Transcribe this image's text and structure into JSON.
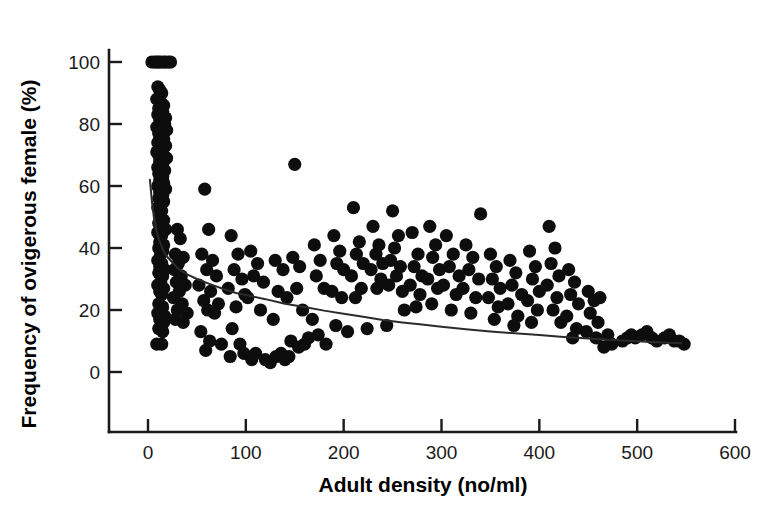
{
  "chart_data": {
    "type": "scatter",
    "title": "",
    "xlabel": "Adult density (no/ml)",
    "ylabel": "Frequency of ovigerous female (%)",
    "xlim": [
      0,
      600
    ],
    "ylim": [
      0,
      105
    ],
    "xticks": [
      0,
      100,
      200,
      300,
      400,
      500,
      600
    ],
    "yticks": [
      0,
      20,
      40,
      60,
      80,
      100
    ],
    "xtick_labels": [
      "0",
      "100",
      "200",
      "300",
      "400",
      "500",
      "600"
    ],
    "ytick_labels": [
      "0",
      "20",
      "40",
      "60",
      "80",
      "100"
    ],
    "grid": false,
    "legend": null,
    "marker": {
      "shape": "circle",
      "color": "#0d0d0d",
      "size": 9
    },
    "series": [
      {
        "name": "Observations",
        "points": [
          [
            4,
            100
          ],
          [
            7,
            100
          ],
          [
            9,
            100
          ],
          [
            11,
            100
          ],
          [
            13,
            100
          ],
          [
            16,
            100
          ],
          [
            18,
            100
          ],
          [
            21,
            100
          ],
          [
            23,
            100
          ],
          [
            10,
            92
          ],
          [
            12,
            91
          ],
          [
            14,
            90
          ],
          [
            9,
            88
          ],
          [
            13,
            87
          ],
          [
            16,
            86
          ],
          [
            11,
            85
          ],
          [
            15,
            84
          ],
          [
            10,
            83
          ],
          [
            18,
            82
          ],
          [
            12,
            81
          ],
          [
            14,
            80
          ],
          [
            17,
            80
          ],
          [
            9,
            79
          ],
          [
            13,
            78
          ],
          [
            19,
            78
          ],
          [
            11,
            77
          ],
          [
            15,
            76
          ],
          [
            12,
            75
          ],
          [
            16,
            75
          ],
          [
            10,
            74
          ],
          [
            14,
            73
          ],
          [
            18,
            73
          ],
          [
            13,
            72
          ],
          [
            9,
            71
          ],
          [
            16,
            70
          ],
          [
            11,
            70
          ],
          [
            14,
            69
          ],
          [
            19,
            69
          ],
          [
            12,
            68
          ],
          [
            15,
            67
          ],
          [
            10,
            66
          ],
          [
            13,
            65
          ],
          [
            17,
            65
          ],
          [
            11,
            64
          ],
          [
            15,
            63
          ],
          [
            12,
            62
          ],
          [
            16,
            61
          ],
          [
            10,
            60
          ],
          [
            14,
            60
          ],
          [
            18,
            59
          ],
          [
            12,
            58
          ],
          [
            15,
            57
          ],
          [
            11,
            56
          ],
          [
            16,
            55
          ],
          [
            13,
            54
          ],
          [
            10,
            53
          ],
          [
            14,
            52
          ],
          [
            12,
            50
          ],
          [
            16,
            49
          ],
          [
            11,
            48
          ],
          [
            15,
            47
          ],
          [
            13,
            46
          ],
          [
            18,
            46
          ],
          [
            10,
            45
          ],
          [
            14,
            44
          ],
          [
            12,
            42
          ],
          [
            16,
            41
          ],
          [
            11,
            40
          ],
          [
            15,
            39
          ],
          [
            13,
            38
          ],
          [
            10,
            36
          ],
          [
            14,
            35
          ],
          [
            12,
            34
          ],
          [
            17,
            33
          ],
          [
            11,
            32
          ],
          [
            15,
            31
          ],
          [
            13,
            29
          ],
          [
            10,
            28
          ],
          [
            16,
            27
          ],
          [
            12,
            26
          ],
          [
            14,
            25
          ],
          [
            11,
            22
          ],
          [
            15,
            21
          ],
          [
            13,
            20
          ],
          [
            10,
            19
          ],
          [
            17,
            18
          ],
          [
            12,
            17
          ],
          [
            16,
            16
          ],
          [
            14,
            15
          ],
          [
            11,
            14
          ],
          [
            15,
            13
          ],
          [
            9,
            9
          ],
          [
            14,
            9
          ],
          [
            30,
            46
          ],
          [
            33,
            43
          ],
          [
            28,
            38
          ],
          [
            36,
            37
          ],
          [
            31,
            35
          ],
          [
            27,
            33
          ],
          [
            34,
            31
          ],
          [
            29,
            29
          ],
          [
            38,
            28
          ],
          [
            32,
            26
          ],
          [
            26,
            24
          ],
          [
            35,
            22
          ],
          [
            30,
            20
          ],
          [
            40,
            19
          ],
          [
            28,
            17
          ],
          [
            36,
            16
          ],
          [
            58,
            59
          ],
          [
            62,
            46
          ],
          [
            55,
            38
          ],
          [
            66,
            36
          ],
          [
            60,
            33
          ],
          [
            70,
            31
          ],
          [
            52,
            28
          ],
          [
            64,
            26
          ],
          [
            57,
            23
          ],
          [
            72,
            22
          ],
          [
            61,
            20
          ],
          [
            68,
            19
          ],
          [
            54,
            13
          ],
          [
            63,
            10
          ],
          [
            75,
            9
          ],
          [
            59,
            7
          ],
          [
            85,
            44
          ],
          [
            92,
            38
          ],
          [
            88,
            33
          ],
          [
            96,
            30
          ],
          [
            82,
            27
          ],
          [
            99,
            25
          ],
          [
            90,
            21
          ],
          [
            86,
            14
          ],
          [
            94,
            9
          ],
          [
            98,
            6
          ],
          [
            84,
            5
          ],
          [
            105,
            39
          ],
          [
            112,
            35
          ],
          [
            108,
            31
          ],
          [
            118,
            29
          ],
          [
            102,
            24
          ],
          [
            115,
            20
          ],
          [
            110,
            6
          ],
          [
            120,
            4
          ],
          [
            106,
            4
          ],
          [
            125,
            3
          ],
          [
            130,
            36
          ],
          [
            138,
            33
          ],
          [
            133,
            26
          ],
          [
            142,
            24
          ],
          [
            128,
            17
          ],
          [
            136,
            6
          ],
          [
            144,
            5
          ],
          [
            131,
            5
          ],
          [
            140,
            4
          ],
          [
            150,
            67
          ],
          [
            148,
            37
          ],
          [
            155,
            34
          ],
          [
            152,
            27
          ],
          [
            158,
            20
          ],
          [
            146,
            10
          ],
          [
            160,
            9
          ],
          [
            154,
            8
          ],
          [
            164,
            11
          ],
          [
            170,
            41
          ],
          [
            176,
            36
          ],
          [
            172,
            31
          ],
          [
            180,
            27
          ],
          [
            168,
            17
          ],
          [
            174,
            12
          ],
          [
            182,
            9
          ],
          [
            190,
            44
          ],
          [
            196,
            39
          ],
          [
            193,
            35
          ],
          [
            200,
            33
          ],
          [
            188,
            26
          ],
          [
            198,
            24
          ],
          [
            192,
            15
          ],
          [
            204,
            13
          ],
          [
            210,
            53
          ],
          [
            216,
            42
          ],
          [
            213,
            38
          ],
          [
            220,
            35
          ],
          [
            208,
            31
          ],
          [
            218,
            27
          ],
          [
            212,
            24
          ],
          [
            224,
            14
          ],
          [
            230,
            47
          ],
          [
            236,
            41
          ],
          [
            233,
            38
          ],
          [
            240,
            35
          ],
          [
            228,
            33
          ],
          [
            238,
            30
          ],
          [
            234,
            27
          ],
          [
            244,
            15
          ],
          [
            250,
            52
          ],
          [
            256,
            44
          ],
          [
            252,
            40
          ],
          [
            248,
            36
          ],
          [
            258,
            34
          ],
          [
            254,
            31
          ],
          [
            246,
            28
          ],
          [
            260,
            26
          ],
          [
            262,
            20
          ],
          [
            270,
            45
          ],
          [
            276,
            38
          ],
          [
            272,
            34
          ],
          [
            280,
            31
          ],
          [
            268,
            28
          ],
          [
            278,
            25
          ],
          [
            274,
            21
          ],
          [
            288,
            47
          ],
          [
            294,
            41
          ],
          [
            291,
            37
          ],
          [
            298,
            33
          ],
          [
            286,
            30
          ],
          [
            296,
            27
          ],
          [
            290,
            22
          ],
          [
            305,
            44
          ],
          [
            312,
            38
          ],
          [
            308,
            34
          ],
          [
            318,
            31
          ],
          [
            302,
            28
          ],
          [
            315,
            25
          ],
          [
            310,
            20
          ],
          [
            325,
            41
          ],
          [
            332,
            37
          ],
          [
            328,
            33
          ],
          [
            338,
            30
          ],
          [
            322,
            27
          ],
          [
            340,
            51
          ],
          [
            335,
            24
          ],
          [
            330,
            19
          ],
          [
            350,
            38
          ],
          [
            356,
            34
          ],
          [
            352,
            30
          ],
          [
            360,
            27
          ],
          [
            348,
            24
          ],
          [
            358,
            21
          ],
          [
            354,
            17
          ],
          [
            370,
            36
          ],
          [
            376,
            32
          ],
          [
            372,
            28
          ],
          [
            382,
            25
          ],
          [
            368,
            22
          ],
          [
            378,
            18
          ],
          [
            374,
            15
          ],
          [
            390,
            39
          ],
          [
            396,
            34
          ],
          [
            393,
            30
          ],
          [
            400,
            26
          ],
          [
            388,
            23
          ],
          [
            398,
            20
          ],
          [
            392,
            16
          ],
          [
            410,
            47
          ],
          [
            416,
            40
          ],
          [
            412,
            35
          ],
          [
            420,
            31
          ],
          [
            408,
            28
          ],
          [
            418,
            24
          ],
          [
            414,
            20
          ],
          [
            422,
            16
          ],
          [
            430,
            33
          ],
          [
            436,
            29
          ],
          [
            432,
            25
          ],
          [
            440,
            22
          ],
          [
            428,
            18
          ],
          [
            438,
            14
          ],
          [
            434,
            11
          ],
          [
            450,
            26
          ],
          [
            456,
            23
          ],
          [
            452,
            19
          ],
          [
            460,
            16
          ],
          [
            448,
            13
          ],
          [
            462,
            24
          ],
          [
            458,
            11
          ],
          [
            470,
            12
          ],
          [
            466,
            8
          ],
          [
            474,
            9
          ],
          [
            485,
            10
          ],
          [
            490,
            11
          ],
          [
            494,
            12
          ],
          [
            498,
            11
          ],
          [
            505,
            12
          ],
          [
            510,
            13
          ],
          [
            515,
            11
          ],
          [
            520,
            10
          ],
          [
            528,
            11
          ],
          [
            533,
            12
          ],
          [
            538,
            10
          ],
          [
            543,
            10
          ],
          [
            548,
            9
          ]
        ]
      }
    ],
    "fit_curve": {
      "name": "Fitted power curve",
      "description": "Declining power-law fit through scatter",
      "points": [
        [
          2,
          62
        ],
        [
          4,
          55
        ],
        [
          6,
          50
        ],
        [
          9,
          45
        ],
        [
          12,
          42
        ],
        [
          16,
          39
        ],
        [
          20,
          37
        ],
        [
          26,
          35
        ],
        [
          32,
          33
        ],
        [
          40,
          31.5
        ],
        [
          50,
          30
        ],
        [
          62,
          28.5
        ],
        [
          75,
          27
        ],
        [
          90,
          25.5
        ],
        [
          105,
          24.5
        ],
        [
          120,
          23.5
        ],
        [
          140,
          22
        ],
        [
          160,
          21
        ],
        [
          180,
          19.8
        ],
        [
          200,
          18.8
        ],
        [
          220,
          17.8
        ],
        [
          240,
          16.8
        ],
        [
          260,
          16
        ],
        [
          280,
          15.3
        ],
        [
          300,
          14.6
        ],
        [
          325,
          13.8
        ],
        [
          350,
          13.1
        ],
        [
          375,
          12.5
        ],
        [
          400,
          11.9
        ],
        [
          425,
          11.3
        ],
        [
          450,
          10.8
        ],
        [
          475,
          10.3
        ],
        [
          500,
          9.9
        ],
        [
          520,
          9.6
        ],
        [
          545,
          9.3
        ]
      ]
    }
  },
  "axis": {
    "x_title": "Adult density (no/ml)",
    "y_title": "Frequency of ovigerous female (%)"
  }
}
